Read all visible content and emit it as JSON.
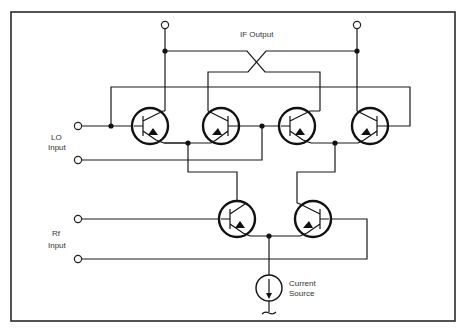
{
  "diagram": {
    "labels": {
      "if_output": "IF Output",
      "lo_input_line1": "LO",
      "lo_input_line2": "Input",
      "rf_input_line1": "Rf",
      "rf_input_line2": "Input",
      "current_source_line1": "Current",
      "current_source_line2": "Source"
    },
    "components": [
      {
        "id": "Q1",
        "type": "npn-transistor",
        "role": "LO switching pair A (left)"
      },
      {
        "id": "Q2",
        "type": "npn-transistor",
        "role": "LO switching pair A (right)"
      },
      {
        "id": "Q3",
        "type": "npn-transistor",
        "role": "LO switching pair B (left)"
      },
      {
        "id": "Q4",
        "type": "npn-transistor",
        "role": "LO switching pair B (right)"
      },
      {
        "id": "Q5",
        "type": "npn-transistor",
        "role": "Rf transconductance (left)"
      },
      {
        "id": "Q6",
        "type": "npn-transistor",
        "role": "Rf transconductance (right)"
      },
      {
        "id": "I1",
        "type": "current-source",
        "role": "tail current source"
      }
    ],
    "terminals": [
      {
        "id": "if_out_left",
        "role": "IF output terminal"
      },
      {
        "id": "if_out_right",
        "role": "IF output terminal"
      },
      {
        "id": "lo_in_top",
        "role": "LO input terminal"
      },
      {
        "id": "lo_in_bottom",
        "role": "LO input terminal"
      },
      {
        "id": "rf_in_top",
        "role": "Rf input terminal"
      },
      {
        "id": "rf_in_bottom",
        "role": "Rf input terminal"
      }
    ]
  }
}
